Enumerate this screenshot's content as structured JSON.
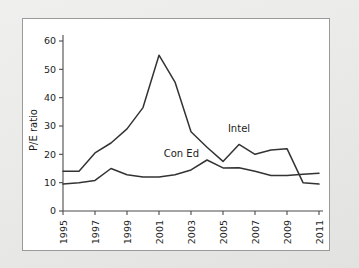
{
  "chart_data": {
    "type": "line",
    "title": "",
    "xlabel": "",
    "ylabel": "P/E ratio",
    "xlim": [
      1995,
      2011
    ],
    "ylim": [
      0,
      60
    ],
    "ytick_values": [
      0,
      10,
      20,
      30,
      40,
      50,
      60
    ],
    "ytick_labels": [
      "0",
      "10",
      "20",
      "30",
      "40",
      "50",
      "60"
    ],
    "xtick_values": [
      1995,
      1997,
      1999,
      2001,
      2003,
      2005,
      2007,
      2009,
      2011
    ],
    "xtick_labels": [
      "1995",
      "1997",
      "1999",
      "2001",
      "2003",
      "2005",
      "2007",
      "2009",
      "2011"
    ],
    "x": [
      1995,
      1996,
      1997,
      1998,
      1999,
      2000,
      2001,
      2002,
      2003,
      2004,
      2005,
      2006,
      2007,
      2008,
      2009,
      2010,
      2011
    ],
    "grid": false,
    "legend_position": "inline-labels",
    "series": [
      {
        "name": "Intel",
        "color": "#333333",
        "values": [
          14,
          14,
          20.5,
          24,
          29,
          36.5,
          55,
          45.5,
          28,
          22.5,
          17.5,
          23.5,
          20,
          21.5,
          22,
          10,
          9.5
        ],
        "label_text": "Intel",
        "label_x": 2006,
        "label_y": 28
      },
      {
        "name": "Con Ed",
        "color": "#333333",
        "values": [
          9.5,
          10,
          10.8,
          15,
          12.8,
          12,
          12,
          12.8,
          14.5,
          18,
          15.2,
          15.3,
          14,
          12.5,
          12.5,
          13,
          13.3
        ],
        "label_text": "Con Ed",
        "label_x": 2002.4,
        "label_y": 19.2
      }
    ]
  },
  "figure": {
    "background_color": "#e8e8e6",
    "panel_color": "#ffffff",
    "panel_border_color": "#9a9a9a",
    "line_color": "#333333",
    "text_color": "#1d1d1d"
  }
}
